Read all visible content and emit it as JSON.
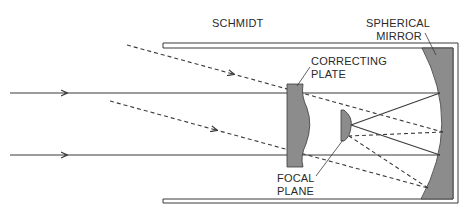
{
  "diagram": {
    "title": "SCHMIDT",
    "labels": {
      "mirror_line1": "SPHERICAL",
      "mirror_line2": "MIRROR",
      "plate_line1": "CORRECTING",
      "plate_line2": "PLATE",
      "focal_line1": "FOCAL",
      "focal_line2": "PLANE"
    },
    "colors": {
      "line": "#3a3a3a",
      "optic_fill": "#8c8c8c",
      "tube_fill": "#ffffff"
    },
    "rays": {
      "solid": [
        {
          "name": "upper-axial-ray",
          "y": 93
        },
        {
          "name": "lower-axial-ray",
          "y": 155
        }
      ],
      "dashed": [
        {
          "name": "upper-oblique-ray",
          "start": [
            127,
            45
          ]
        },
        {
          "name": "lower-oblique-ray",
          "start": [
            110,
            101
          ]
        }
      ]
    }
  }
}
